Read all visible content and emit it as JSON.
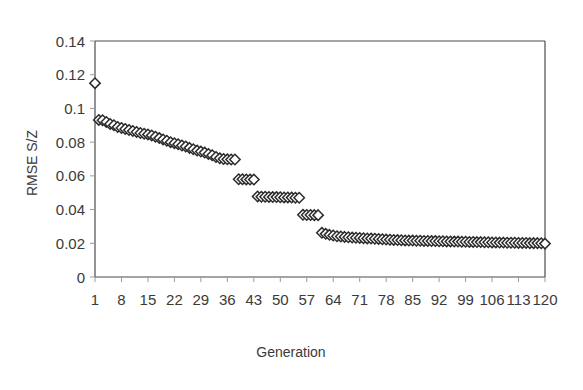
{
  "chart_data": {
    "type": "scatter",
    "title": "",
    "xlabel": "Generation",
    "ylabel": "RMSE S/Z",
    "xlim": [
      1,
      120
    ],
    "ylim": [
      0,
      0.14
    ],
    "grid": false,
    "legend": "none",
    "marker": "open-diamond",
    "marker_fill": "#ffffff",
    "marker_edge": "#2b2b2b",
    "xticks": [
      1,
      8,
      15,
      22,
      29,
      36,
      43,
      50,
      57,
      64,
      71,
      78,
      85,
      92,
      99,
      106,
      113,
      120
    ],
    "xtick_labels": [
      "1",
      "8",
      "15",
      "22",
      "29",
      "36",
      "43",
      "50",
      "57",
      "64",
      "71",
      "78",
      "85",
      "92",
      "99",
      "106",
      "113",
      "120"
    ],
    "yticks": [
      0,
      0.02,
      0.04,
      0.06,
      0.08,
      0.1,
      0.12,
      0.14
    ],
    "ytick_labels": [
      "0",
      "0.02",
      "0.04",
      "0.06",
      "0.08",
      "0.1",
      "0.12",
      "0.14"
    ],
    "series": [
      {
        "name": "RMSE S/Z",
        "x": [
          1,
          2,
          3,
          4,
          5,
          6,
          7,
          8,
          9,
          10,
          11,
          12,
          13,
          14,
          15,
          16,
          17,
          18,
          19,
          20,
          21,
          22,
          23,
          24,
          25,
          26,
          27,
          28,
          29,
          30,
          31,
          32,
          33,
          34,
          35,
          36,
          37,
          38,
          39,
          40,
          41,
          42,
          43,
          44,
          45,
          46,
          47,
          48,
          49,
          50,
          51,
          52,
          53,
          54,
          55,
          56,
          57,
          58,
          59,
          60,
          61,
          62,
          63,
          64,
          65,
          66,
          67,
          68,
          69,
          70,
          71,
          72,
          73,
          74,
          75,
          76,
          77,
          78,
          79,
          80,
          81,
          82,
          83,
          84,
          85,
          86,
          87,
          88,
          89,
          90,
          91,
          92,
          93,
          94,
          95,
          96,
          97,
          98,
          99,
          100,
          101,
          102,
          103,
          104,
          105,
          106,
          107,
          108,
          109,
          110,
          111,
          112,
          113,
          114,
          115,
          116,
          117,
          118,
          119,
          120
        ],
        "y": [
          0.115,
          0.0932,
          0.093,
          0.092,
          0.0908,
          0.09,
          0.089,
          0.0884,
          0.0878,
          0.0872,
          0.0866,
          0.086,
          0.0854,
          0.085,
          0.0846,
          0.084,
          0.0832,
          0.0824,
          0.0816,
          0.0808,
          0.08,
          0.0794,
          0.0788,
          0.078,
          0.0774,
          0.0766,
          0.0758,
          0.075,
          0.0744,
          0.0738,
          0.073,
          0.0722,
          0.0712,
          0.0704,
          0.07,
          0.0698,
          0.0697,
          0.0697,
          0.058,
          0.058,
          0.0579,
          0.0578,
          0.0578,
          0.0478,
          0.0476,
          0.0476,
          0.0475,
          0.0474,
          0.0474,
          0.0473,
          0.0472,
          0.0472,
          0.0471,
          0.047,
          0.047,
          0.0369,
          0.0368,
          0.0368,
          0.0367,
          0.0367,
          0.0262,
          0.0256,
          0.025,
          0.0246,
          0.0242,
          0.024,
          0.0238,
          0.0236,
          0.0234,
          0.0233,
          0.0232,
          0.023,
          0.0229,
          0.0228,
          0.0227,
          0.0226,
          0.0224,
          0.0222,
          0.0221,
          0.022,
          0.0219,
          0.0218,
          0.0217,
          0.0216,
          0.0216,
          0.0215,
          0.0215,
          0.0214,
          0.0214,
          0.0213,
          0.0213,
          0.0212,
          0.0212,
          0.0211,
          0.0211,
          0.021,
          0.021,
          0.0209,
          0.0209,
          0.0208,
          0.0208,
          0.0207,
          0.0207,
          0.0206,
          0.0206,
          0.0205,
          0.0205,
          0.0204,
          0.0204,
          0.0203,
          0.0203,
          0.0203,
          0.0202,
          0.0202,
          0.0202,
          0.0201,
          0.0201,
          0.0201,
          0.02,
          0.0198
        ]
      }
    ]
  }
}
